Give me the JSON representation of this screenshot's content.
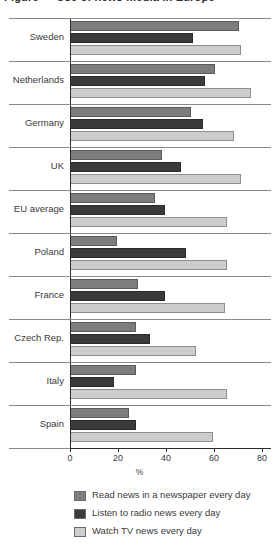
{
  "title": "Figure — Use of news media in Europe",
  "chart_data": {
    "type": "bar",
    "orientation": "horizontal",
    "title": "Figure — Use of news media in Europe",
    "xlabel": "%",
    "ylabel": "",
    "xlim": [
      0,
      90
    ],
    "xticks": [
      0,
      20,
      40,
      60,
      80
    ],
    "xtick_labels": [
      "0",
      "20",
      "40",
      "60",
      "80"
    ],
    "grid": false,
    "legend_position": "bottom",
    "categories": [
      "Sweden",
      "Netherlands",
      "Germany",
      "UK",
      "EU average",
      "Poland",
      "France",
      "Czech Rep.",
      "Italy",
      "Spain"
    ],
    "series": [
      {
        "name": "Read news in a newspaper every day",
        "color": "#7d7d7d",
        "values": [
          70,
          60,
          50,
          38,
          35,
          19,
          28,
          27,
          27,
          24
        ]
      },
      {
        "name": "Listen to radio news every day",
        "color": "#3a3a3a",
        "values": [
          51,
          56,
          55,
          46,
          39,
          48,
          39,
          33,
          18,
          27
        ]
      },
      {
        "name": "Watch TV news every day",
        "color": "#cdcdcd",
        "values": [
          71,
          75,
          68,
          71,
          65,
          65,
          64,
          52,
          65,
          59
        ]
      }
    ]
  },
  "axis": {
    "x_unit_label": "%"
  },
  "legend": {
    "items": [
      {
        "label": "Read news in a newspaper every day",
        "color": "#7d7d7d",
        "swatch": "legend-swatch-newspaper"
      },
      {
        "label": "Listen to radio news every day",
        "color": "#3a3a3a",
        "swatch": "legend-swatch-radio"
      },
      {
        "label": "Watch TV news every day",
        "color": "#cdcdcd",
        "swatch": "legend-swatch-tv"
      }
    ]
  }
}
